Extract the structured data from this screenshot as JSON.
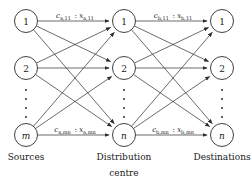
{
  "diagram": {
    "columns": [
      {
        "id": "sources",
        "caption": "Sources",
        "caption_line2": "",
        "cx": 26,
        "nodes": [
          {
            "label": "1",
            "cy": 21,
            "italic": false
          },
          {
            "label": "2",
            "cy": 68,
            "italic": false
          },
          {
            "label": "m",
            "cy": 135,
            "italic": true
          }
        ],
        "ellipsis_cy": [
          90,
          99,
          108,
          117
        ]
      },
      {
        "id": "distribution-centre",
        "caption": "Distribution",
        "caption_line2": "centre",
        "cx": 124,
        "nodes": [
          {
            "label": "1",
            "cy": 21,
            "italic": false
          },
          {
            "label": "2",
            "cy": 68,
            "italic": false
          },
          {
            "label": "n",
            "cy": 135,
            "italic": true
          }
        ],
        "ellipsis_cy": [
          90,
          99,
          108,
          117
        ]
      },
      {
        "id": "destinations",
        "caption": "Destinations",
        "caption_line2": "",
        "cx": 222,
        "nodes": [
          {
            "label": "1",
            "cy": 21,
            "italic": false
          },
          {
            "label": "2",
            "cy": 68,
            "italic": false
          },
          {
            "label": "n",
            "cy": 135,
            "italic": true
          }
        ],
        "ellipsis_cy": [
          90,
          99,
          108,
          117
        ]
      }
    ],
    "node_radius": 11.5,
    "edge_labels": [
      {
        "id": "label-a-11",
        "text": "c_a,11 : x_a,11",
        "cost_symbol": "c",
        "cost_sub": "a,11",
        "flow_symbol": "x",
        "flow_sub": "a,11",
        "separator": ":",
        "x": 75,
        "y": 18
      },
      {
        "id": "label-b-11",
        "text": "c_b,11 : x_b,11",
        "cost_symbol": "c",
        "cost_sub": "b,11",
        "flow_symbol": "x",
        "flow_sub": "b,11",
        "separator": ":",
        "x": 173,
        "y": 18
      },
      {
        "id": "label-a-mn",
        "text": "c_a,mn : x_a,mn",
        "cost_symbol": "c",
        "cost_sub": "a,mn",
        "flow_symbol": "x",
        "flow_sub": "a,mn",
        "separator": ":",
        "x": 75,
        "y": 132
      },
      {
        "id": "label-b-mn",
        "text": "c_b,mn : x_b,mn",
        "cost_symbol": "c",
        "cost_sub": "b,mn",
        "flow_symbol": "x",
        "flow_sub": "b,mn",
        "separator": ":",
        "x": 173,
        "y": 132
      }
    ],
    "caption_y": 160,
    "caption_y2": 176,
    "colors": {
      "stroke": "#2b2b2b",
      "text": "#1a1a1a",
      "background": "#ffffff"
    },
    "edges_stage_a": [
      {
        "from": 0,
        "to": 0
      },
      {
        "from": 0,
        "to": 1
      },
      {
        "from": 0,
        "to": 2
      },
      {
        "from": 1,
        "to": 0
      },
      {
        "from": 1,
        "to": 1
      },
      {
        "from": 1,
        "to": 2
      },
      {
        "from": 2,
        "to": 0
      },
      {
        "from": 2,
        "to": 1
      },
      {
        "from": 2,
        "to": 2
      }
    ],
    "edges_stage_b": [
      {
        "from": 0,
        "to": 0
      },
      {
        "from": 0,
        "to": 1
      },
      {
        "from": 0,
        "to": 2
      },
      {
        "from": 1,
        "to": 0
      },
      {
        "from": 1,
        "to": 1
      },
      {
        "from": 1,
        "to": 2
      },
      {
        "from": 2,
        "to": 0
      },
      {
        "from": 2,
        "to": 1
      },
      {
        "from": 2,
        "to": 2
      }
    ]
  }
}
